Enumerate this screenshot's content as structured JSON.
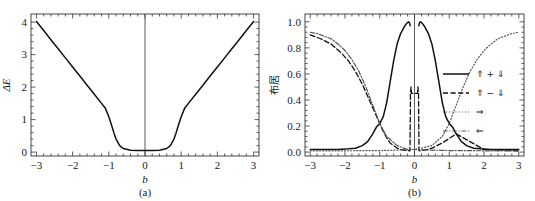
{
  "figure": {
    "panels": [
      "a",
      "b"
    ]
  },
  "panel_a": {
    "caption": "(a)",
    "xlabel": "b",
    "ylabel": "ΔE",
    "xticks": [
      "-3",
      "-2",
      "-1",
      "0",
      "1",
      "2",
      "3"
    ],
    "yticks": [
      "0",
      "1",
      "2",
      "3",
      "4"
    ]
  },
  "panel_b": {
    "caption": "(b)",
    "xlabel": "b",
    "ylabel": "布居",
    "xticks": [
      "-3",
      "-2",
      "-1",
      "0",
      "1",
      "2",
      "3"
    ],
    "yticks": [
      "0.0",
      "0.2",
      "0.4",
      "0.6",
      "0.8",
      "1.0"
    ],
    "legend": [
      {
        "label": "⇑ + ⇓",
        "style": "solid"
      },
      {
        "label": "⇑ − ⇓",
        "style": "dashed"
      },
      {
        "label": "⇒",
        "style": "dotted"
      },
      {
        "label": "⇐",
        "style": "dashdot"
      }
    ]
  },
  "chart_data": [
    {
      "type": "line",
      "panel": "a",
      "title": "(a)",
      "xlabel": "b",
      "ylabel": "ΔE",
      "xlim": [
        -3.15,
        3.15
      ],
      "ylim": [
        -0.12,
        4.25
      ],
      "xticks": [
        -3,
        -2,
        -1,
        0,
        1,
        2,
        3
      ],
      "yticks": [
        0,
        1,
        2,
        3,
        4
      ],
      "grid": false,
      "legend": "none",
      "annotations": [
        "vertical line at b = 0"
      ],
      "series": [
        {
          "name": "ΔE",
          "style": "solid",
          "color": "#111111",
          "x": [
            -3.0,
            -2.8,
            -2.6,
            -2.4,
            -2.2,
            -2.0,
            -1.8,
            -1.6,
            -1.4,
            -1.2,
            -1.1,
            -1.0,
            -0.95,
            -0.9,
            -0.85,
            -0.8,
            -0.7,
            -0.6,
            -0.4,
            -0.2,
            0.0,
            0.2,
            0.4,
            0.6,
            0.7,
            0.8,
            0.85,
            0.9,
            0.95,
            1.0,
            1.1,
            1.2,
            1.4,
            1.6,
            1.8,
            2.0,
            2.2,
            2.4,
            2.6,
            2.8,
            3.0
          ],
          "y": [
            4.02,
            3.74,
            3.46,
            3.18,
            2.9,
            2.62,
            2.34,
            2.06,
            1.78,
            1.5,
            1.36,
            1.09,
            0.92,
            0.74,
            0.56,
            0.4,
            0.2,
            0.11,
            0.06,
            0.05,
            0.05,
            0.05,
            0.06,
            0.11,
            0.2,
            0.4,
            0.56,
            0.74,
            0.92,
            1.09,
            1.36,
            1.5,
            1.78,
            2.06,
            2.34,
            2.62,
            2.9,
            3.18,
            3.46,
            3.74,
            4.02
          ]
        }
      ]
    },
    {
      "type": "line",
      "panel": "b",
      "title": "(b)",
      "xlabel": "b",
      "ylabel": "布居",
      "xlim": [
        -3.15,
        3.15
      ],
      "ylim": [
        -0.03,
        1.06
      ],
      "xticks": [
        -3,
        -2,
        -1,
        0,
        1,
        2,
        3
      ],
      "yticks": [
        0.0,
        0.2,
        0.4,
        0.6,
        0.8,
        1.0
      ],
      "grid": false,
      "legend": "right-middle",
      "annotations": [
        "vertical line at b = 0",
        "narrow central feature between b = -0.12 and b = 0.12"
      ],
      "series": [
        {
          "name": "⇑ + ⇓",
          "style": "solid",
          "color": "#111111",
          "x": [
            -3.0,
            -2.6,
            -2.2,
            -1.9,
            -1.7,
            -1.5,
            -1.35,
            -1.2,
            -1.1,
            -1.0,
            -0.9,
            -0.8,
            -0.7,
            -0.6,
            -0.5,
            -0.4,
            -0.3,
            -0.22,
            -0.17,
            -0.14,
            -0.125,
            0.125,
            0.14,
            0.17,
            0.22,
            0.3,
            0.4,
            0.5,
            0.6,
            0.7,
            0.8,
            0.9,
            1.0,
            1.1,
            1.2,
            1.35,
            1.5,
            1.7,
            1.9,
            2.2,
            2.6,
            3.0
          ],
          "y": [
            0.02,
            0.02,
            0.02,
            0.025,
            0.03,
            0.05,
            0.08,
            0.14,
            0.19,
            0.22,
            0.27,
            0.38,
            0.54,
            0.7,
            0.83,
            0.91,
            0.96,
            0.99,
            1.0,
            0.99,
            0.97,
            0.97,
            0.99,
            1.0,
            0.99,
            0.96,
            0.91,
            0.83,
            0.7,
            0.54,
            0.38,
            0.27,
            0.22,
            0.19,
            0.14,
            0.08,
            0.05,
            0.03,
            0.025,
            0.02,
            0.02,
            0.02
          ]
        },
        {
          "name": "⇑ − ⇓",
          "style": "dashed",
          "color": "#111111",
          "x": [
            -3.0,
            -2.7,
            -2.4,
            -2.1,
            -1.9,
            -1.7,
            -1.5,
            -1.3,
            -1.15,
            -1.0,
            -0.9,
            -0.8,
            -0.7,
            -0.6,
            -0.5,
            -0.4,
            -0.3,
            -0.2,
            -0.13,
            -0.115,
            -0.1,
            -0.085,
            0.085,
            0.1,
            0.115,
            0.13,
            0.2,
            0.3,
            0.5,
            0.8,
            1.2,
            2.0,
            3.0
          ],
          "y": [
            0.9,
            0.87,
            0.83,
            0.76,
            0.7,
            0.62,
            0.52,
            0.4,
            0.31,
            0.22,
            0.16,
            0.11,
            0.07,
            0.05,
            0.03,
            0.02,
            0.015,
            0.012,
            0.01,
            0.45,
            0.5,
            0.45,
            0.45,
            0.5,
            0.45,
            0.01,
            0.012,
            0.015,
            0.03,
            0.07,
            0.14,
            0.02,
            0.01
          ]
        },
        {
          "name": "⇒",
          "style": "dotted",
          "color": "#555555",
          "x": [
            -3.0,
            -2.0,
            -1.0,
            -0.5,
            -0.2,
            0.0,
            0.2,
            0.5,
            0.8,
            1.0,
            1.2,
            1.4,
            1.6,
            1.8,
            2.0,
            2.2,
            2.4,
            2.6,
            2.8,
            3.0
          ],
          "y": [
            0.01,
            0.01,
            0.012,
            0.015,
            0.02,
            0.02,
            0.03,
            0.05,
            0.12,
            0.22,
            0.36,
            0.5,
            0.62,
            0.71,
            0.78,
            0.83,
            0.87,
            0.89,
            0.91,
            0.92
          ]
        },
        {
          "name": "⇐",
          "style": "dashdot",
          "color": "#555555",
          "x": [
            -3.0,
            -2.8,
            -2.6,
            -2.4,
            -2.2,
            -2.0,
            -1.8,
            -1.6,
            -1.4,
            -1.2,
            -1.0,
            -0.8,
            -0.5,
            -0.2,
            0.0,
            0.5,
            1.0,
            2.0,
            3.0
          ],
          "y": [
            0.92,
            0.91,
            0.89,
            0.87,
            0.83,
            0.78,
            0.71,
            0.62,
            0.5,
            0.36,
            0.22,
            0.12,
            0.05,
            0.02,
            0.02,
            0.015,
            0.012,
            0.01,
            0.01
          ]
        }
      ]
    }
  ]
}
